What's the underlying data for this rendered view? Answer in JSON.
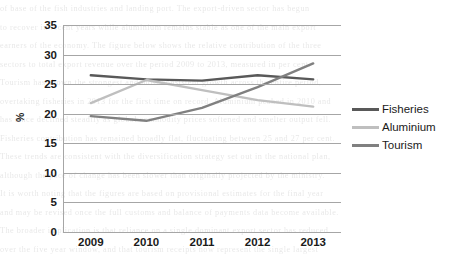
{
  "chart_data": {
    "type": "line",
    "title": "",
    "xlabel": "",
    "ylabel": "%",
    "categories": [
      "2009",
      "2010",
      "2011",
      "2012",
      "2013"
    ],
    "ylim": [
      0,
      35
    ],
    "ytick_step": 5,
    "yticks": [
      "35",
      "30",
      "25",
      "20",
      "15",
      "10",
      "5",
      "0"
    ],
    "grid": true,
    "legend_position": "right",
    "series": [
      {
        "name": "Fisheries",
        "color": "#595959",
        "values": [
          26.5,
          25.8,
          25.6,
          26.5,
          25.8
        ]
      },
      {
        "name": "Aluminium",
        "color": "#bfbfbf",
        "values": [
          21.8,
          25.7,
          24.0,
          22.3,
          21.2
        ]
      },
      {
        "name": "Tourism",
        "color": "#808080",
        "values": [
          19.6,
          18.8,
          21.0,
          24.5,
          28.5
        ]
      }
    ]
  },
  "legend": {
    "items": [
      {
        "label": "Fisheries"
      },
      {
        "label": "Aluminium"
      },
      {
        "label": "Tourism"
      }
    ]
  },
  "axes": {
    "y_title": "%"
  },
  "background_text": {
    "lines": [
      "of base      of the fish industries and landing port.      The export-driven sector has begun",
      "to recover in recent years while aluminium remains stable as one of the main export",
      "earners of the economy. The figure below shows the relative contribution of the three",
      "sectors to total export revenue over the period 2009 to 2013, measured in per cent.",
      "Tourism has shown the strongest and most consistent growth across the entire period,",
      "overtaking fisheries in 2013 for the first time on record. Aluminium peaked in 2010 and",
      "has since declined steadily as global commodity prices softened and smelter output fell.",
      "Fisheries contribution has remained broadly flat, fluctuating between 25 and 27 per cent.",
      "These trends are consistent with the diversification strategy set out in the national plan,",
      "although the pace of change has been slower than originally projected by the ministry.",
      "It is worth noting that the figures are based on provisional estimates for the final year",
      "and may be revised once the full customs and balance of payments data become available.",
      "The broader implication is that reliance on a single dominant export sector has reduced",
      "over the five year window, and that tourism receipts now represent the single largest"
    ]
  }
}
